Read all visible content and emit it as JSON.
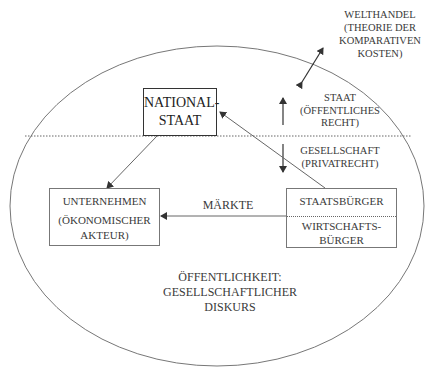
{
  "diagram": {
    "world_trade": {
      "line1": "WELTHANDEL",
      "line2": "(THEORIE DER",
      "line3": "KOMPARATIVEN",
      "line4": "KOSTEN)"
    },
    "state_label": {
      "line1": "STAAT",
      "line2": "(ÖFFENTLICHES",
      "line3": "RECHT)"
    },
    "society_label": {
      "line1": "GESELLSCHAFT",
      "line2": "(PRIVATRECHT)"
    },
    "nation_state": {
      "line1": "NATIONAL-",
      "line2": "STAAT"
    },
    "enterprise": {
      "line1": "UNTERNEHMEN",
      "line2": "(ÖKONOMISCHER",
      "line3": "AKTEUR)"
    },
    "citizen": {
      "top": "STAATSBÜRGER",
      "bottom_line1": "WIRTSCHAFTS-",
      "bottom_line2": "BÜRGER"
    },
    "markets_label": "MÄRKTE",
    "public_sphere": {
      "line1": "ÖFFENTLICHKEIT:",
      "line2": "GESELLSCHAFTLICHER",
      "line3": "DISKURS"
    },
    "colors": {
      "line": "#555555",
      "ellipse": "#777777",
      "text": "#3a3a3a"
    }
  }
}
